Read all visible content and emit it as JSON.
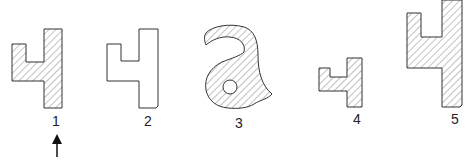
{
  "figures": [
    {
      "label": "1",
      "style": "hatched",
      "shape": "profile"
    },
    {
      "label": "2",
      "style": "outline",
      "shape": "profile"
    },
    {
      "label": "3",
      "style": "hatched",
      "shape": "curved-hook-with-hole"
    },
    {
      "label": "4",
      "style": "hatched",
      "shape": "profile-small"
    },
    {
      "label": "5",
      "style": "hatched",
      "shape": "profile-large"
    }
  ],
  "indicator": {
    "target": "1",
    "icon": "up-arrow-icon"
  },
  "colors": {
    "stroke": "#333333",
    "hatch": "#555555",
    "background": "#ffffff"
  }
}
